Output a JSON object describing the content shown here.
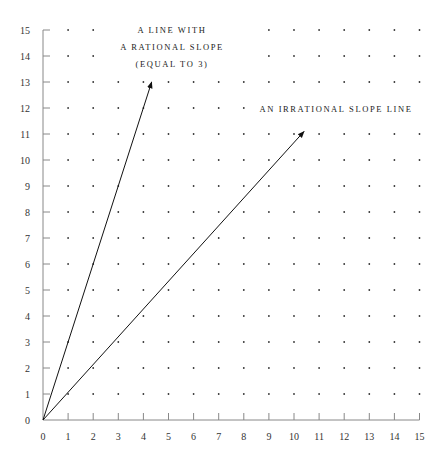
{
  "chart_data": {
    "type": "line",
    "title": "",
    "xlabel": "",
    "ylabel": "",
    "xlim": [
      0,
      15
    ],
    "ylim": [
      0,
      15
    ],
    "x_ticks": [
      "0",
      "1",
      "2",
      "3",
      "4",
      "5",
      "6",
      "7",
      "8",
      "9",
      "10",
      "11",
      "12",
      "13",
      "14",
      "15"
    ],
    "y_ticks": [
      "0",
      "1",
      "2",
      "3",
      "4",
      "5",
      "6",
      "7",
      "8",
      "9",
      "10",
      "11",
      "12",
      "13",
      "14",
      "15"
    ],
    "grid": "dots at integer lattice points",
    "series": [
      {
        "name": "A line with a rational slope (equal to 3)",
        "slope": 3,
        "start": [
          0,
          0
        ],
        "end": [
          4.33,
          13
        ],
        "arrow": true
      },
      {
        "name": "An irrational slope line",
        "slope": 1.07,
        "start": [
          0,
          0
        ],
        "end": [
          10.4,
          11.1
        ],
        "arrow": true
      }
    ],
    "annotations": [
      {
        "lines": [
          "A LINE WITH",
          "A RATIONAL SLOPE",
          "(EQUAL TO 3)"
        ],
        "x": 5.3,
        "y": 14.3
      },
      {
        "lines": [
          "AN IRRATIONAL SLOPE LINE"
        ],
        "x": 11.6,
        "y": 11.9
      }
    ]
  },
  "labels": {
    "annot1_line1": "A LINE WITH",
    "annot1_line2": "A RATIONAL SLOPE",
    "annot1_line3": "(EQUAL TO 3)",
    "annot2": "AN IRRATIONAL SLOPE LINE"
  }
}
